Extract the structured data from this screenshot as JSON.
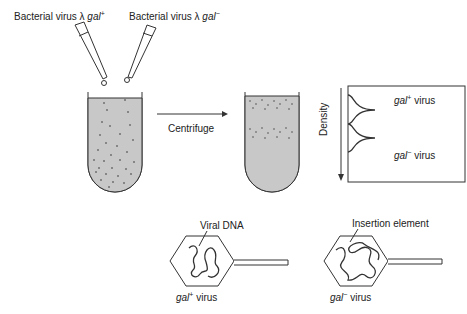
{
  "labels": {
    "virus_plus": {
      "prefix": "Bacterial virus λ ",
      "gene": "gal",
      "sup": "+"
    },
    "virus_minus": {
      "prefix": "Bacterial virus λ ",
      "gene": "gal",
      "sup": "−"
    },
    "centrifuge": "Centrifuge",
    "density_axis": "Density",
    "peak_plus": {
      "gene": "gal",
      "sup": "+",
      "suffix": " virus"
    },
    "peak_minus": {
      "gene": "gal",
      "sup": "−",
      "suffix": " virus"
    },
    "viral_dna": "Viral DNA",
    "insertion_element": "Insertion element",
    "phage_plus": {
      "gene": "gal",
      "sup": "+",
      "suffix": " virus"
    },
    "phage_minus": {
      "gene": "gal",
      "sup": "−",
      "suffix": " virus"
    }
  },
  "colors": {
    "liquid": "#c8c8c8",
    "line": "#333333"
  }
}
